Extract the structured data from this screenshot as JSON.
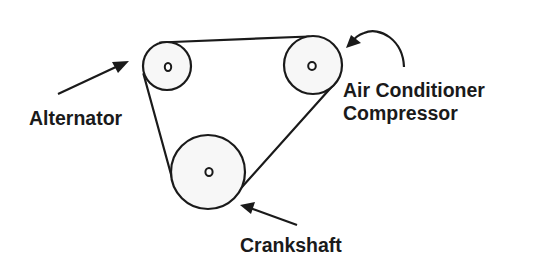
{
  "diagram": {
    "colors": {
      "line": "#1a1a1a",
      "pulley_fill": "#f7f7f7",
      "background": "#ffffff"
    },
    "components": [
      {
        "id": "alternator",
        "label": "Alternator"
      },
      {
        "id": "ac_compressor",
        "label_line1": "Air Conditioner",
        "label_line2": "Compressor"
      },
      {
        "id": "crankshaft",
        "label": "Crankshaft"
      }
    ],
    "labels": {
      "alternator": "Alternator",
      "ac_line1": "Air Conditioner",
      "ac_line2": "Compressor",
      "crankshaft": "Crankshaft"
    }
  }
}
